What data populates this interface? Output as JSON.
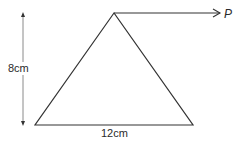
{
  "figure": {
    "type": "triangle-with-force",
    "shape": "triangle",
    "vertices": {
      "apex": [
        114,
        13
      ],
      "base_left": [
        35,
        125
      ],
      "base_right": [
        193,
        125
      ]
    },
    "labels": {
      "height": "8cm",
      "base": "12cm",
      "force": "P"
    },
    "dimensions": {
      "height_cm": 8,
      "base_cm": 12
    },
    "force_arrow": {
      "from": [
        114,
        13
      ],
      "to": [
        220,
        13
      ],
      "direction": "right",
      "label": "P"
    },
    "colors": {
      "stroke": "#333333",
      "dimension_line": "#8a8a8a",
      "background": "#ffffff"
    }
  }
}
